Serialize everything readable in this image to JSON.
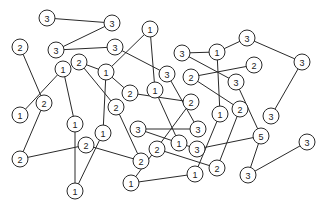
{
  "diagram": {
    "type": "hashi-bridges-graph",
    "node_radius": 8,
    "colors": {
      "line": "#2a2a2a",
      "fill": "#ffffff",
      "text": "#222222"
    },
    "nodes": [
      {
        "id": "n1",
        "label": "3",
        "x": 47,
        "y": 18
      },
      {
        "id": "n2",
        "label": "3",
        "x": 112,
        "y": 23
      },
      {
        "id": "n3",
        "label": "2",
        "x": 20,
        "y": 47
      },
      {
        "id": "n4",
        "label": "3",
        "x": 56,
        "y": 50
      },
      {
        "id": "n5",
        "label": "3",
        "x": 115,
        "y": 47
      },
      {
        "id": "n6",
        "label": "1",
        "x": 150,
        "y": 29
      },
      {
        "id": "n7",
        "label": "3",
        "x": 182,
        "y": 53
      },
      {
        "id": "n8",
        "label": "1",
        "x": 217,
        "y": 52
      },
      {
        "id": "n9",
        "label": "3",
        "x": 247,
        "y": 38
      },
      {
        "id": "n10",
        "label": "3",
        "x": 302,
        "y": 62
      },
      {
        "id": "n11",
        "label": "2",
        "x": 254,
        "y": 65
      },
      {
        "id": "n12",
        "label": "1",
        "x": 63,
        "y": 69
      },
      {
        "id": "n13",
        "label": "2",
        "x": 79,
        "y": 62
      },
      {
        "id": "n14",
        "label": "1",
        "x": 106,
        "y": 72
      },
      {
        "id": "n15",
        "label": "3",
        "x": 167,
        "y": 74
      },
      {
        "id": "n16",
        "label": "2",
        "x": 191,
        "y": 77
      },
      {
        "id": "n17",
        "label": "3",
        "x": 236,
        "y": 82
      },
      {
        "id": "n18",
        "label": "1",
        "x": 155,
        "y": 90
      },
      {
        "id": "n19",
        "label": "2",
        "x": 130,
        "y": 93
      },
      {
        "id": "n20",
        "label": "2",
        "x": 44,
        "y": 103
      },
      {
        "id": "n21",
        "label": "1",
        "x": 20,
        "y": 115
      },
      {
        "id": "n22",
        "label": "2",
        "x": 116,
        "y": 107
      },
      {
        "id": "n23",
        "label": "2",
        "x": 191,
        "y": 102
      },
      {
        "id": "n24",
        "label": "2",
        "x": 240,
        "y": 109
      },
      {
        "id": "n25",
        "label": "1",
        "x": 220,
        "y": 114
      },
      {
        "id": "n26",
        "label": "3",
        "x": 271,
        "y": 116
      },
      {
        "id": "n27",
        "label": "1",
        "x": 75,
        "y": 124
      },
      {
        "id": "n28",
        "label": "1",
        "x": 103,
        "y": 133
      },
      {
        "id": "n29",
        "label": "3",
        "x": 138,
        "y": 129
      },
      {
        "id": "n30",
        "label": "3",
        "x": 198,
        "y": 129
      },
      {
        "id": "n31",
        "label": "5",
        "x": 261,
        "y": 136
      },
      {
        "id": "n32",
        "label": "1",
        "x": 179,
        "y": 143
      },
      {
        "id": "n33",
        "label": "3",
        "x": 307,
        "y": 142
      },
      {
        "id": "n34",
        "label": "2",
        "x": 86,
        "y": 145
      },
      {
        "id": "n35",
        "label": "2",
        "x": 157,
        "y": 149
      },
      {
        "id": "n36",
        "label": "3",
        "x": 197,
        "y": 149
      },
      {
        "id": "n37",
        "label": "2",
        "x": 20,
        "y": 159
      },
      {
        "id": "n38",
        "label": "2",
        "x": 141,
        "y": 161
      },
      {
        "id": "n39",
        "label": "2",
        "x": 217,
        "y": 168
      },
      {
        "id": "n40",
        "label": "1",
        "x": 195,
        "y": 174
      },
      {
        "id": "n41",
        "label": "3",
        "x": 248,
        "y": 175
      },
      {
        "id": "n42",
        "label": "1",
        "x": 131,
        "y": 183
      },
      {
        "id": "n43",
        "label": "1",
        "x": 75,
        "y": 191
      }
    ],
    "edges": [
      [
        "n1",
        "n2"
      ],
      [
        "n2",
        "n4"
      ],
      [
        "n4",
        "n5"
      ],
      [
        "n5",
        "n15"
      ],
      [
        "n3",
        "n20"
      ],
      [
        "n12",
        "n21"
      ],
      [
        "n12",
        "n27"
      ],
      [
        "n13",
        "n14"
      ],
      [
        "n13",
        "n22"
      ],
      [
        "n14",
        "n6"
      ],
      [
        "n14",
        "n28"
      ],
      [
        "n14",
        "n19"
      ],
      [
        "n19",
        "n23"
      ],
      [
        "n6",
        "n18"
      ],
      [
        "n18",
        "n32"
      ],
      [
        "n15",
        "n30"
      ],
      [
        "n22",
        "n38"
      ],
      [
        "n20",
        "n37"
      ],
      [
        "n37",
        "n34"
      ],
      [
        "n34",
        "n38"
      ],
      [
        "n27",
        "n43"
      ],
      [
        "n28",
        "n43"
      ],
      [
        "n29",
        "n30"
      ],
      [
        "n29",
        "n32"
      ],
      [
        "n32",
        "n36"
      ],
      [
        "n36",
        "n31"
      ],
      [
        "n23",
        "n42"
      ],
      [
        "n42",
        "n40"
      ],
      [
        "n35",
        "n39"
      ],
      [
        "n7",
        "n8"
      ],
      [
        "n8",
        "n9"
      ],
      [
        "n8",
        "n25"
      ],
      [
        "n25",
        "n40"
      ],
      [
        "n7",
        "n17"
      ],
      [
        "n17",
        "n31"
      ],
      [
        "n11",
        "n16"
      ],
      [
        "n16",
        "n24"
      ],
      [
        "n24",
        "n39"
      ],
      [
        "n9",
        "n10"
      ],
      [
        "n10",
        "n26"
      ],
      [
        "n31",
        "n41"
      ],
      [
        "n41",
        "n33"
      ]
    ]
  }
}
